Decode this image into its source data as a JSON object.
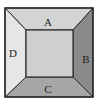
{
  "diagram": {
    "type": "frustum-top-view",
    "regions": {
      "top": {
        "label": "A",
        "color": "#d4d4d4"
      },
      "right": {
        "label": "B",
        "color": "#8a8a8a"
      },
      "bottom": {
        "label": "C",
        "color": "#a6a6a6"
      },
      "left": {
        "label": "D",
        "color": "#e6e6e6"
      },
      "center": {
        "label": "",
        "color": "#cfcfcf"
      }
    },
    "stroke_color": "#2a2a2a"
  }
}
